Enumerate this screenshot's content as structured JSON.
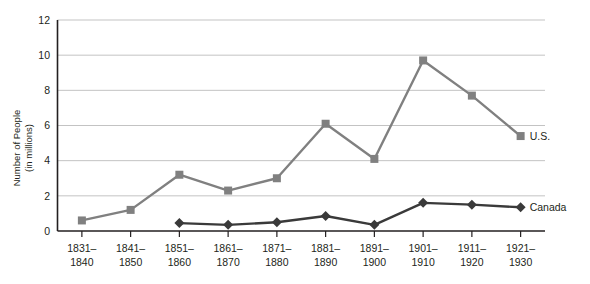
{
  "chart_data": {
    "type": "line",
    "title": "",
    "subtitle": "",
    "xlabel": "",
    "ylabel": "Number of People\n(in millions)",
    "ylabel_line1": "Number of People",
    "ylabel_line2": "(in millions)",
    "ylim": [
      0,
      12
    ],
    "yticks": [
      0,
      2,
      4,
      6,
      8,
      10,
      12
    ],
    "ytick_labels": [
      "0",
      "2",
      "4",
      "6",
      "8",
      "10",
      "12"
    ],
    "grid": true,
    "grid_axis": "y",
    "legend_position": "inline-right",
    "categories": [
      "1831–\n1840",
      "1841–\n1850",
      "1851–\n1860",
      "1861–\n1870",
      "1871–\n1880",
      "1881–\n1890",
      "1891–\n1900",
      "1901–\n1910",
      "1911–\n1920",
      "1921–\n1930"
    ],
    "category_lines": [
      [
        "1831–",
        "1840"
      ],
      [
        "1841–",
        "1850"
      ],
      [
        "1851–",
        "1860"
      ],
      [
        "1861–",
        "1870"
      ],
      [
        "1871–",
        "1880"
      ],
      [
        "1881–",
        "1890"
      ],
      [
        "1891–",
        "1900"
      ],
      [
        "1901–",
        "1910"
      ],
      [
        "1911–",
        "1920"
      ],
      [
        "1921–",
        "1930"
      ]
    ],
    "series": [
      {
        "name": "U.S.",
        "color": "#808080",
        "marker": "square",
        "values": [
          0.6,
          1.2,
          3.2,
          2.3,
          3.0,
          6.1,
          4.1,
          9.7,
          7.7,
          5.4
        ]
      },
      {
        "name": "Canada",
        "color": "#3a3a3a",
        "marker": "diamond",
        "values": [
          null,
          null,
          0.45,
          0.35,
          0.5,
          0.85,
          0.35,
          1.6,
          1.5,
          1.35
        ]
      }
    ]
  },
  "labels": {
    "us": "U.S.",
    "canada": "Canada"
  },
  "colors": {
    "us_series": "#808080",
    "canada_series": "#3a3a3a",
    "gridline": "#bcbcbc",
    "axis": "#231f20",
    "background": "#ffffff"
  }
}
